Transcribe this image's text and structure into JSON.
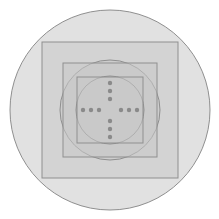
{
  "figure": {
    "canvas": {
      "width": 219,
      "height": 219,
      "background": "#ffffff"
    },
    "style": {
      "fill_color": "#c9c9c9",
      "fill_opacity": 0.55,
      "stroke_color": "#8f8f8f",
      "stroke_width": 1,
      "dot_color": "#8a8a8a"
    },
    "center": {
      "x": 110,
      "y": 110
    },
    "layers": [
      {
        "name": "outer-circle",
        "type": "circle",
        "cx": 110,
        "cy": 110,
        "r": 100
      },
      {
        "name": "outer-square",
        "type": "square",
        "x": 42,
        "y": 42,
        "size": 136
      },
      {
        "name": "middle-circle",
        "type": "circle",
        "cx": 110,
        "cy": 110,
        "r": 50
      },
      {
        "name": "middle-square",
        "type": "square",
        "x": 63,
        "y": 63,
        "size": 94
      },
      {
        "name": "inner-circle",
        "type": "circle",
        "cx": 110,
        "cy": 110,
        "r": 34
      },
      {
        "name": "inner-square",
        "type": "square",
        "x": 77,
        "y": 77,
        "size": 66
      }
    ],
    "dot_cross": {
      "name": "center-dot-cross",
      "dot_radius": 2.2,
      "spacing": 8,
      "dots_per_arm": 3,
      "arms": [
        "left",
        "right",
        "up",
        "down"
      ],
      "left": [
        {
          "x": 83,
          "y": 110
        },
        {
          "x": 91,
          "y": 110
        },
        {
          "x": 99,
          "y": 110
        }
      ],
      "right": [
        {
          "x": 121,
          "y": 110
        },
        {
          "x": 129,
          "y": 110
        },
        {
          "x": 137,
          "y": 110
        }
      ],
      "up": [
        {
          "x": 110,
          "y": 83
        },
        {
          "x": 110,
          "y": 91
        },
        {
          "x": 110,
          "y": 99
        }
      ],
      "down": [
        {
          "x": 110,
          "y": 121
        },
        {
          "x": 110,
          "y": 129
        },
        {
          "x": 110,
          "y": 137
        }
      ]
    }
  }
}
